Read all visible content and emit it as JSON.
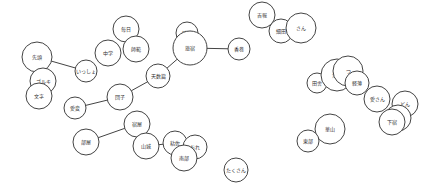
{
  "diagram": {
    "type": "network-graph",
    "style": {
      "node_fill": "#ffffff",
      "node_stroke": "#444444",
      "edge_color": "#444444",
      "label_color": "#333333",
      "background": "#ffffff"
    },
    "nodes": [
      {
        "id": "n_sentou",
        "label": "先頭"
      },
      {
        "id": "n_gorugi",
        "label": "ゴルキ"
      },
      {
        "id": "n_bunji",
        "label": "文字"
      },
      {
        "id": "n_issho",
        "label": "いっしょ"
      },
      {
        "id": "n_chuugaku",
        "label": "中学"
      },
      {
        "id": "n_mainichi",
        "label": "毎日"
      },
      {
        "id": "n_shihan",
        "label": "師範"
      },
      {
        "id": "n_hojin",
        "label": "補陣"
      },
      {
        "id": "n_ryoshuku",
        "label": "旅宿"
      },
      {
        "id": "n_kouka",
        "label": "香巻"
      },
      {
        "id": "n_tendoku",
        "label": "天数篇"
      },
      {
        "id": "n_dango",
        "label": "団子"
      },
      {
        "id": "n_aihen",
        "label": "愛変"
      },
      {
        "id": "n_kippou",
        "label": "吉報"
      },
      {
        "id": "n_hosoda",
        "label": "細田"
      },
      {
        "id": "n_san",
        "label": "さん"
      },
      {
        "id": "n_inaka",
        "label": "田舎"
      },
      {
        "id": "n_edo",
        "label": "江戸"
      },
      {
        "id": "n_tsu",
        "label": "つ"
      },
      {
        "id": "n_keihaku",
        "label": "軽薄"
      },
      {
        "id": "n_aisan",
        "label": "愛さん"
      },
      {
        "id": "n_don",
        "label": "どん"
      },
      {
        "id": "n_hosogiri",
        "label": "細切"
      },
      {
        "id": "n_shimoya",
        "label": "下宿"
      },
      {
        "id": "n_kazan",
        "label": "華山"
      },
      {
        "id": "n_toubu",
        "label": "東部"
      },
      {
        "id": "n_heya",
        "label": "部屋"
      },
      {
        "id": "n_yadoya",
        "label": "宿屋"
      },
      {
        "id": "n_yamashiro",
        "label": "山城"
      },
      {
        "id": "n_nenza",
        "label": "粘佐"
      },
      {
        "id": "n_ore",
        "label": "おれ"
      },
      {
        "id": "n_nanbu",
        "label": "南部"
      },
      {
        "id": "n_takusan",
        "label": "たくさん"
      }
    ],
    "edges": [
      {
        "from": "n_sentou",
        "to": "n_issho"
      },
      {
        "from": "n_aihen",
        "to": "n_dango"
      },
      {
        "from": "n_dango",
        "to": "n_tendoku"
      },
      {
        "from": "n_tendoku",
        "to": "n_ryoshuku"
      },
      {
        "from": "n_ryoshuku",
        "to": "n_kouka"
      },
      {
        "from": "n_heya",
        "to": "n_yadoya"
      },
      {
        "from": "n_yamashiro",
        "to": "n_nenza"
      }
    ]
  }
}
